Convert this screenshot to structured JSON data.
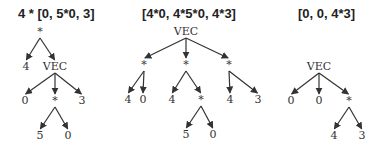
{
  "trees": [
    {
      "title": "4 * [0, 5*0, 3]",
      "title_x": 18,
      "nodes": [
        {
          "id": "r",
          "label": "*",
          "x": 40,
          "y": 35
        },
        {
          "id": "a",
          "label": "4",
          "x": 26,
          "y": 70
        },
        {
          "id": "v",
          "label": "VEC",
          "x": 55,
          "y": 70
        },
        {
          "id": "b",
          "label": "0",
          "x": 25,
          "y": 104
        },
        {
          "id": "m",
          "label": "*",
          "x": 55,
          "y": 104
        },
        {
          "id": "c",
          "label": "3",
          "x": 82,
          "y": 104
        },
        {
          "id": "d",
          "label": "5",
          "x": 40,
          "y": 139
        },
        {
          "id": "e",
          "label": "0",
          "x": 68,
          "y": 139
        }
      ],
      "edges": [
        [
          "r",
          "a"
        ],
        [
          "r",
          "v"
        ],
        [
          "v",
          "b"
        ],
        [
          "v",
          "m"
        ],
        [
          "v",
          "c"
        ],
        [
          "m",
          "d"
        ],
        [
          "m",
          "e"
        ]
      ]
    },
    {
      "title": "[4*0, 4*5*0, 4*3]",
      "title_x": 142,
      "nodes": [
        {
          "id": "v",
          "label": "VEC",
          "x": 186,
          "y": 35
        },
        {
          "id": "s1",
          "label": "*",
          "x": 144,
          "y": 68
        },
        {
          "id": "s2",
          "label": "*",
          "x": 186,
          "y": 68
        },
        {
          "id": "s3",
          "label": "*",
          "x": 229,
          "y": 68
        },
        {
          "id": "a",
          "label": "4",
          "x": 128,
          "y": 103
        },
        {
          "id": "b",
          "label": "0",
          "x": 143,
          "y": 103
        },
        {
          "id": "c",
          "label": "4",
          "x": 172,
          "y": 103
        },
        {
          "id": "m",
          "label": "*",
          "x": 201,
          "y": 103
        },
        {
          "id": "d",
          "label": "4",
          "x": 230,
          "y": 103
        },
        {
          "id": "e",
          "label": "3",
          "x": 258,
          "y": 103
        },
        {
          "id": "f",
          "label": "5",
          "x": 186,
          "y": 138
        },
        {
          "id": "g",
          "label": "0",
          "x": 213,
          "y": 138
        }
      ],
      "edges": [
        [
          "v",
          "s1"
        ],
        [
          "v",
          "s2"
        ],
        [
          "v",
          "s3"
        ],
        [
          "s1",
          "a"
        ],
        [
          "s1",
          "b"
        ],
        [
          "s2",
          "c"
        ],
        [
          "s2",
          "m"
        ],
        [
          "s3",
          "d"
        ],
        [
          "s3",
          "e"
        ],
        [
          "m",
          "f"
        ],
        [
          "m",
          "g"
        ]
      ]
    },
    {
      "title": "[0, 0, 4*3]",
      "title_x": 298,
      "nodes": [
        {
          "id": "v",
          "label": "VEC",
          "x": 319,
          "y": 70
        },
        {
          "id": "a",
          "label": "0",
          "x": 291,
          "y": 104
        },
        {
          "id": "b",
          "label": "0",
          "x": 319,
          "y": 104
        },
        {
          "id": "m",
          "label": "*",
          "x": 349,
          "y": 104
        },
        {
          "id": "c",
          "label": "4",
          "x": 334,
          "y": 139
        },
        {
          "id": "d",
          "label": "3",
          "x": 362,
          "y": 139
        }
      ],
      "edges": [
        [
          "v",
          "a"
        ],
        [
          "v",
          "b"
        ],
        [
          "v",
          "m"
        ],
        [
          "m",
          "c"
        ],
        [
          "m",
          "d"
        ]
      ]
    }
  ]
}
